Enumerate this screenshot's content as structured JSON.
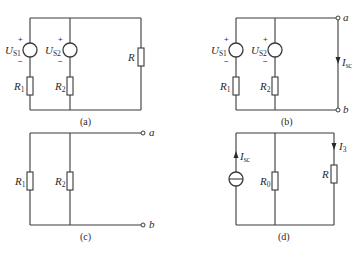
{
  "diagram": {
    "type": "circuit-schematics",
    "panels": [
      {
        "id": "a",
        "caption": "(a)",
        "sources": [
          {
            "label": "U",
            "sub": "S1",
            "plus": "+",
            "minus": "−"
          },
          {
            "label": "U",
            "sub": "S2",
            "plus": "+",
            "minus": "−"
          }
        ],
        "resistors": [
          {
            "label": "R",
            "sub": "1"
          },
          {
            "label": "R",
            "sub": "2"
          },
          {
            "label": "R",
            "sub": ""
          }
        ]
      },
      {
        "id": "b",
        "caption": "(b)",
        "sources": [
          {
            "label": "U",
            "sub": "S1",
            "plus": "+",
            "minus": "−"
          },
          {
            "label": "U",
            "sub": "S2",
            "plus": "+",
            "minus": "−"
          }
        ],
        "resistors": [
          {
            "label": "R",
            "sub": "1"
          },
          {
            "label": "R",
            "sub": "2"
          }
        ],
        "terminals": [
          "a",
          "b"
        ],
        "current": {
          "label": "I",
          "sub": "sc"
        }
      },
      {
        "id": "c",
        "caption": "(c)",
        "resistors": [
          {
            "label": "R",
            "sub": "1"
          },
          {
            "label": "R",
            "sub": "2"
          }
        ],
        "terminals": [
          "a",
          "b"
        ]
      },
      {
        "id": "d",
        "caption": "(d)",
        "current_source": {
          "label": "I",
          "sub": "sc"
        },
        "resistors": [
          {
            "label": "R",
            "sub": "0"
          },
          {
            "label": "R",
            "sub": ""
          }
        ],
        "current": {
          "label": "I",
          "sub": "3"
        }
      }
    ]
  }
}
